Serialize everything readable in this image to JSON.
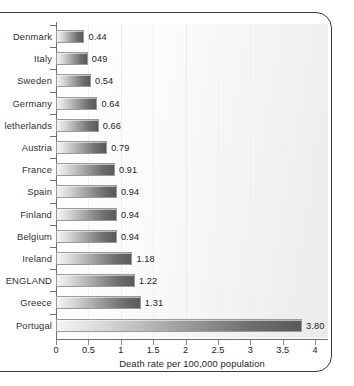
{
  "chart_data": {
    "type": "bar",
    "orientation": "horizontal",
    "title": "",
    "xlabel": "Death rate per 100,000 population",
    "ylabel": "",
    "xlim": [
      0,
      4.2
    ],
    "xticks": [
      0,
      0.5,
      1,
      1.5,
      2,
      2.5,
      3,
      3.5,
      4
    ],
    "xtick_labels": [
      "0",
      "0.5",
      "1",
      "1.5",
      "2",
      "2.5",
      "3",
      "3.5",
      "4"
    ],
    "grid": "vertical-faint",
    "legend": null,
    "categories": [
      "Denmark",
      "Italy",
      "Sweden",
      "Germany",
      "Netherlands",
      "Austria",
      "France",
      "Spain",
      "Finland",
      "Belgium",
      "Ireland",
      "ENGLAND",
      "Greece",
      "Portugal"
    ],
    "values": [
      0.44,
      0.49,
      0.54,
      0.64,
      0.66,
      0.79,
      0.91,
      0.94,
      0.94,
      0.94,
      1.18,
      1.22,
      1.31,
      3.8
    ],
    "data_labels": [
      "0.44",
      "049",
      "0.54",
      "0.64",
      "0.66",
      "0.79",
      "0.91",
      "0.94",
      "0.94",
      "0.94",
      "1.18",
      "1.22",
      "1.31",
      "3.80"
    ],
    "display_categories": [
      "Denmark",
      "Italy",
      "Sweden",
      "Germany",
      "letherlands",
      "Austria",
      "France",
      "Spain",
      "Finland",
      "Belgium",
      "Ireland",
      "ENGLAND",
      "Greece",
      "Portugal"
    ],
    "colors": {
      "bar_light": "#f4f4f4",
      "bar_dark": "#5a5a5a",
      "bar_border": "#9a9a9c",
      "axis": "#6e6e70",
      "text": "#232325",
      "frame": "#3a3a3c",
      "plot_background": "#f3f3f3"
    }
  }
}
